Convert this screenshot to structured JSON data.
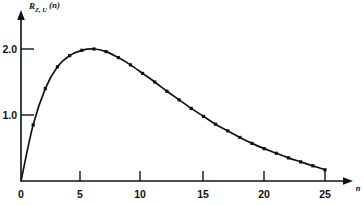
{
  "chart_data": {
    "type": "line",
    "title": "",
    "subtitle": "",
    "xlabel": "n",
    "ylabel": "R_{Z,U}(n)",
    "ylabel_parts": {
      "main": "R",
      "subscript": "Z, U",
      "argument": "(n)"
    },
    "xlim": [
      0,
      26.5
    ],
    "ylim": [
      0,
      2.45
    ],
    "xticks": [
      0,
      5,
      10,
      15,
      20,
      25
    ],
    "xticklabels": [
      "0",
      "5",
      "10",
      "15",
      "20",
      "25"
    ],
    "yticks": [
      1.0,
      2.0
    ],
    "yticklabels": [
      "1.0",
      "2.0"
    ],
    "grid": false,
    "legend": null,
    "markers": "filled-square",
    "line_color": "#111111",
    "marker_color": "#111111",
    "background_color": "#ffffff",
    "axis_arrows": true,
    "x": [
      0,
      1,
      2,
      3,
      4,
      5,
      6,
      7,
      8,
      9,
      10,
      11,
      12,
      13,
      14,
      15,
      16,
      17,
      18,
      19,
      20,
      21,
      22,
      23,
      24,
      25
    ],
    "values": [
      0.0,
      0.85,
      1.4,
      1.73,
      1.9,
      1.98,
      2.0,
      1.96,
      1.87,
      1.76,
      1.63,
      1.5,
      1.36,
      1.23,
      1.1,
      0.98,
      0.86,
      0.76,
      0.66,
      0.57,
      0.49,
      0.42,
      0.35,
      0.29,
      0.23,
      0.17
    ],
    "series": [
      {
        "name": "R_{Z,U}(n)",
        "values": [
          0.0,
          0.85,
          1.4,
          1.73,
          1.9,
          1.98,
          2.0,
          1.96,
          1.87,
          1.76,
          1.63,
          1.5,
          1.36,
          1.23,
          1.1,
          0.98,
          0.86,
          0.76,
          0.66,
          0.57,
          0.49,
          0.42,
          0.35,
          0.29,
          0.23,
          0.17
        ]
      }
    ],
    "annotations": []
  },
  "axes": {
    "y_tick_2_label": "2.0",
    "y_tick_1_label": "1.0",
    "x_tick_0_label": "0",
    "x_tick_5_label": "5",
    "x_tick_10_label": "10",
    "x_tick_15_label": "15",
    "x_tick_20_label": "20",
    "x_tick_25_label": "25",
    "x_axis_name": "n",
    "y_axis_main": "R",
    "y_axis_subscript": "Z, U",
    "y_axis_argument": "(n)"
  }
}
